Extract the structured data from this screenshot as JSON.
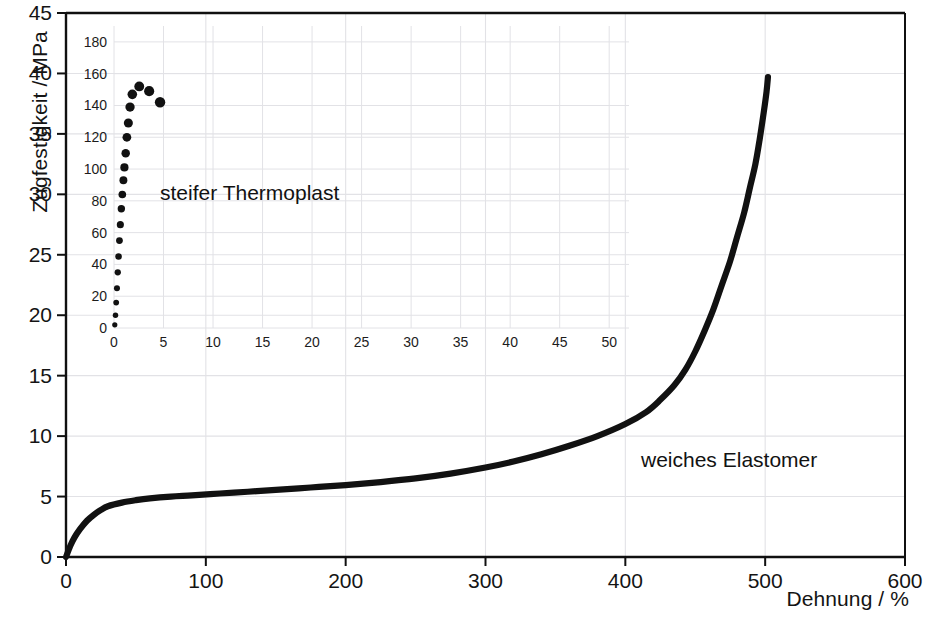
{
  "chart_data": {
    "type": "line",
    "title": "",
    "xlabel": "Dehnung / %",
    "ylabel": "Zugfestigkeit / MPa",
    "xlim": [
      0,
      600
    ],
    "ylim": [
      0,
      45
    ],
    "xticks": [
      0,
      100,
      200,
      300,
      400,
      500,
      600
    ],
    "yticks": [
      0,
      5,
      10,
      15,
      20,
      25,
      30,
      35,
      40,
      45
    ],
    "grid": true,
    "legend": "none",
    "annotations": [
      {
        "text": "weiches Elastomer",
        "x": 430,
        "y": 8
      }
    ],
    "series": [
      {
        "name": "weiches Elastomer",
        "type": "line",
        "color": "#111111",
        "points": [
          [
            0,
            0.0
          ],
          [
            3,
            0.9
          ],
          [
            6,
            1.6
          ],
          [
            10,
            2.3
          ],
          [
            15,
            3.0
          ],
          [
            20,
            3.5
          ],
          [
            25,
            3.9
          ],
          [
            30,
            4.2
          ],
          [
            40,
            4.5
          ],
          [
            50,
            4.7
          ],
          [
            60,
            4.85
          ],
          [
            75,
            5.0
          ],
          [
            90,
            5.1
          ],
          [
            110,
            5.25
          ],
          [
            130,
            5.4
          ],
          [
            150,
            5.55
          ],
          [
            175,
            5.75
          ],
          [
            200,
            5.95
          ],
          [
            225,
            6.2
          ],
          [
            250,
            6.5
          ],
          [
            275,
            6.9
          ],
          [
            300,
            7.4
          ],
          [
            320,
            7.9
          ],
          [
            340,
            8.5
          ],
          [
            360,
            9.2
          ],
          [
            380,
            10.0
          ],
          [
            400,
            11.0
          ],
          [
            415,
            12.0
          ],
          [
            425,
            13.0
          ],
          [
            435,
            14.2
          ],
          [
            443,
            15.5
          ],
          [
            450,
            17.0
          ],
          [
            457,
            18.8
          ],
          [
            463,
            20.5
          ],
          [
            469,
            22.5
          ],
          [
            475,
            24.5
          ],
          [
            480,
            26.5
          ],
          [
            485,
            28.5
          ],
          [
            489,
            30.5
          ],
          [
            493,
            32.5
          ],
          [
            496,
            34.5
          ],
          [
            499,
            36.8
          ],
          [
            501,
            38.5
          ],
          [
            502,
            39.7
          ]
        ]
      }
    ]
  },
  "inset_chart_data": {
    "type": "scatter",
    "title": "",
    "xlabel": "",
    "ylabel": "",
    "xlim": [
      0,
      52
    ],
    "ylim": [
      0,
      190
    ],
    "xticks": [
      0,
      5,
      10,
      15,
      20,
      25,
      30,
      35,
      40,
      45,
      50
    ],
    "yticks": [
      0,
      20,
      40,
      60,
      80,
      100,
      120,
      140,
      160,
      180
    ],
    "grid": true,
    "legend": "none",
    "annotations": [
      {
        "text": "steifer Thermoplast",
        "x": 13,
        "y": 82
      }
    ],
    "series": [
      {
        "name": "steifer Thermoplast",
        "type": "scatter",
        "color": "#111111",
        "points": [
          [
            0.08,
            2
          ],
          [
            0.15,
            8
          ],
          [
            0.22,
            16
          ],
          [
            0.3,
            25
          ],
          [
            0.38,
            35
          ],
          [
            0.46,
            45
          ],
          [
            0.55,
            55
          ],
          [
            0.64,
            65
          ],
          [
            0.74,
            75
          ],
          [
            0.84,
            84
          ],
          [
            0.95,
            93
          ],
          [
            1.05,
            101
          ],
          [
            1.18,
            110
          ],
          [
            1.3,
            120
          ],
          [
            1.45,
            129
          ],
          [
            1.62,
            139
          ],
          [
            1.85,
            147
          ],
          [
            2.55,
            152
          ],
          [
            3.55,
            149
          ],
          [
            4.65,
            142
          ]
        ]
      }
    ]
  },
  "labels": {
    "y_axis_title": "Zugfestigkeit / MPa",
    "x_axis_title": "Dehnung / %",
    "annotation_thermoplast": "steifer Thermoplast",
    "annotation_elastomer": "weiches Elastomer",
    "main_yticks": [
      "0",
      "5",
      "10",
      "15",
      "20",
      "25",
      "30",
      "35",
      "40",
      "45"
    ],
    "main_xticks": [
      "0",
      "100",
      "200",
      "300",
      "400",
      "500",
      "600"
    ],
    "inset_yticks": [
      "0",
      "20",
      "40",
      "60",
      "80",
      "100",
      "120",
      "140",
      "160",
      "180"
    ],
    "inset_xticks": [
      "0",
      "5",
      "10",
      "15",
      "20",
      "25",
      "30",
      "35",
      "40",
      "45",
      "50"
    ]
  },
  "colors": {
    "curve": "#111111",
    "axis": "#101010",
    "grid": "#e2e2e6",
    "background": "#ffffff",
    "text": "#141414"
  }
}
